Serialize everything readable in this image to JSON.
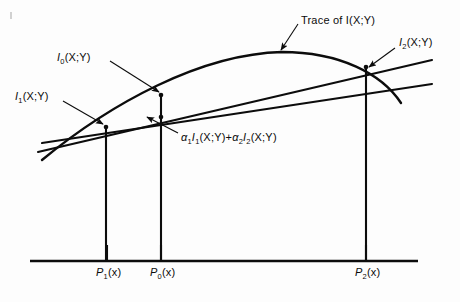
{
  "figure": {
    "type": "diagram",
    "background": "#fdfdfd",
    "ink_color": "#0c0c0c"
  },
  "labels": {
    "trace": {
      "text": "Trace of I(X;Y)",
      "x": 301,
      "y": 14,
      "arrow_from": [
        298,
        24
      ],
      "arrow_to": [
        281,
        50
      ]
    },
    "i0": {
      "text": "I",
      "sub": "0",
      "tail": "(X;Y)",
      "x": 57,
      "y": 51,
      "arrow_from": [
        110,
        61
      ],
      "arrow_to": [
        159,
        92
      ]
    },
    "i1": {
      "text": "I",
      "sub": "1",
      "tail": "(X;Y)",
      "x": 15,
      "y": 90,
      "arrow_from": [
        63,
        101
      ],
      "arrow_to": [
        103,
        124
      ]
    },
    "i2": {
      "text": "I",
      "sub": "2",
      "tail": "(X;Y)",
      "x": 399,
      "y": 36,
      "arrow_from": [
        395,
        48
      ],
      "arrow_to": [
        369,
        67
      ]
    },
    "combination": {
      "text": "α",
      "sub1": "1",
      "mid1": "I",
      "sub2": "1",
      "mid2": "(X;Y)+",
      "text2": "α",
      "sub3": "2",
      "mid3": "I",
      "sub4": "2",
      "mid4": "(X;Y)",
      "x": 181,
      "y": 131,
      "arrow_from": [
        178,
        133
      ],
      "arrow_to": [
        147,
        117
      ]
    }
  },
  "axis": {
    "y": 261,
    "x_start": 30,
    "x_end": 418,
    "ticks": [
      {
        "name": "p1",
        "text": "P",
        "sub": "1",
        "tail": "(x)",
        "x": 107,
        "label_x": 96,
        "label_y": 266
      },
      {
        "name": "p0",
        "text": "P",
        "sub": "0",
        "tail": "(x)",
        "x": 161,
        "label_x": 150,
        "label_y": 266
      },
      {
        "name": "p2",
        "text": "P",
        "sub": "2",
        "tail": "(x)",
        "x": 366,
        "label_x": 355,
        "label_y": 266
      }
    ]
  },
  "geometry": {
    "curve": {
      "name": "trace-of-I",
      "path": "M 42 160 C 110 104, 200 54, 282 52 C 340 52, 382 74, 401 103"
    },
    "line_upper": {
      "name": "upper-straight-line",
      "from": [
        38,
        152
      ],
      "to": [
        432,
        60
      ]
    },
    "line_lower": {
      "name": "lower-straight-line",
      "from": [
        42,
        143
      ],
      "to": [
        432,
        84
      ]
    },
    "verticals": [
      {
        "name": "vertical-p1",
        "x": 106,
        "y_top": 127,
        "y_bottom": 261
      },
      {
        "name": "vertical-p0",
        "x": 161,
        "y_top": 95,
        "y_bottom": 261
      },
      {
        "name": "vertical-p2",
        "x": 366,
        "y_top": 67,
        "y_bottom": 261
      }
    ],
    "points": [
      {
        "name": "point-I1",
        "x": 106,
        "y": 127
      },
      {
        "name": "point-I0",
        "x": 161,
        "y": 95
      },
      {
        "name": "point-combination",
        "x": 161,
        "y": 117
      },
      {
        "name": "point-I2",
        "x": 366,
        "y": 67
      }
    ]
  }
}
